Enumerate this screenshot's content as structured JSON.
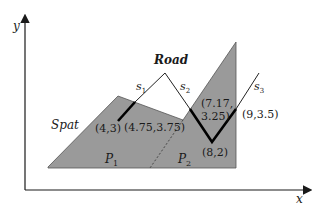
{
  "axes": {
    "x_label": "x",
    "y_label": "y"
  },
  "regions": {
    "spatial_label": "Spat",
    "parcel_1": {
      "label": "P",
      "subscript": "1"
    },
    "parcel_2": {
      "label": "P",
      "subscript": "2"
    },
    "fill_color": "#9a9a9a"
  },
  "road": {
    "label": "Road",
    "segments": [
      {
        "label": "s",
        "subscript": "1"
      },
      {
        "label": "s",
        "subscript": "2"
      },
      {
        "label": "s",
        "subscript": "3"
      }
    ]
  },
  "points": [
    {
      "label": "(4,3)"
    },
    {
      "label": "(4.75,3.75)"
    },
    {
      "label_line1": "(7.17,",
      "label_line2": "3.25)"
    },
    {
      "label": "(8,2)"
    },
    {
      "label": "(9,3.5)"
    }
  ]
}
